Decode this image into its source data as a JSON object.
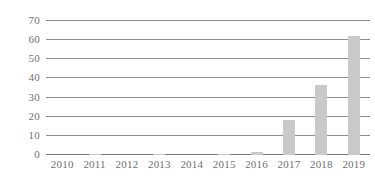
{
  "chart_data": {
    "type": "bar",
    "title": "",
    "subtitle": "",
    "xlabel": "",
    "ylabel": "",
    "categories": [
      "2010",
      "2011",
      "2012",
      "2013",
      "2014",
      "2015",
      "2016",
      "2017",
      "2018",
      "2019"
    ],
    "values": [
      0,
      0.4,
      0,
      0.4,
      0,
      0.4,
      1.5,
      18.5,
      36.5,
      62
    ],
    "series": [
      {
        "name": "",
        "values": [
          0,
          0.4,
          0,
          0.4,
          0,
          0.4,
          1.5,
          18.5,
          36.5,
          62
        ]
      }
    ],
    "ylim": [
      0,
      70
    ],
    "ytick_values": [
      0,
      10,
      20,
      30,
      40,
      50,
      60,
      70
    ],
    "ytick_labels": [
      "0",
      "10",
      "20",
      "30",
      "40",
      "50",
      "60",
      "70"
    ],
    "xtick_labels": [
      "2010",
      "2011",
      "2012",
      "2013",
      "2014",
      "2015",
      "2016",
      "2017",
      "2018",
      "2019"
    ],
    "grid": true,
    "grid_axis": "y",
    "legend": false,
    "legend_position": "none",
    "annotations": [],
    "colors": {
      "bar": "#c9c9c9",
      "gridline": "#8d8d8d",
      "baseline": "#7a7a7a",
      "tick_label": "#6f6f6f",
      "background": "#ffffff"
    }
  }
}
